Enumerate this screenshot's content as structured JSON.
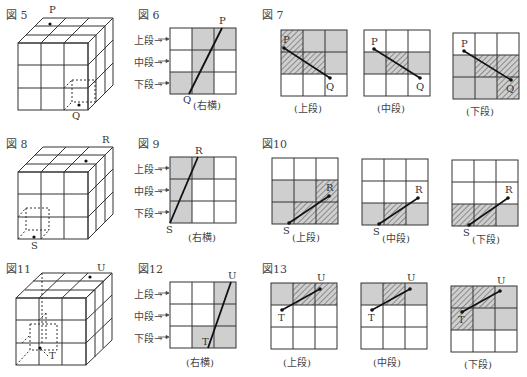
{
  "colors": {
    "gray": "#cfcfcf",
    "line": "#333333",
    "hatch": "#7a7a7a",
    "bg": "#ffffff"
  },
  "row_labels": {
    "top": "上段→",
    "middle": "中段→",
    "bottom": "下段→"
  },
  "figures": {
    "fig5": {
      "label": "図 5",
      "points": [
        "P",
        "Q"
      ]
    },
    "fig6": {
      "label": "図 6",
      "caption": "(右横)",
      "points": [
        "P",
        "Q"
      ],
      "gray_cells": [
        [
          0,
          1
        ],
        [
          0,
          2
        ],
        [
          1,
          1
        ],
        [
          2,
          0
        ],
        [
          2,
          1
        ]
      ]
    },
    "fig7": {
      "label": "図 7",
      "panels": [
        {
          "caption": "(上段)",
          "gray": [
            [
              0,
              1
            ],
            [
              0,
              2
            ],
            [
              1,
              2
            ]
          ],
          "hatch": [
            [
              0,
              0
            ],
            [
              1,
              0
            ],
            [
              1,
              1
            ]
          ],
          "p": "P",
          "q": "Q"
        },
        {
          "caption": "(中段)",
          "gray": [
            [
              1,
              0
            ],
            [
              1,
              2
            ]
          ],
          "hatch": [
            [
              1,
              1
            ]
          ],
          "p": "P",
          "q": "Q"
        },
        {
          "caption": "(下段)",
          "gray": [
            [
              1,
              0
            ],
            [
              2,
              0
            ],
            [
              2,
              1
            ]
          ],
          "hatch": [
            [
              1,
              1
            ],
            [
              1,
              2
            ],
            [
              2,
              2
            ]
          ],
          "p": "P",
          "q": "Q"
        }
      ]
    },
    "fig8": {
      "label": "図 8",
      "points": [
        "R",
        "S"
      ]
    },
    "fig9": {
      "label": "図 9",
      "caption": "(右横)",
      "points": [
        "R",
        "S"
      ],
      "gray_cells": [
        [
          0,
          0
        ],
        [
          0,
          1
        ],
        [
          1,
          0
        ],
        [
          2,
          0
        ]
      ]
    },
    "fig10": {
      "label": "図10",
      "panels": [
        {
          "caption": "(上段)",
          "gray": [
            [
              1,
              0
            ],
            [
              1,
              1
            ],
            [
              2,
              0
            ]
          ],
          "hatch": [
            [
              1,
              2
            ],
            [
              2,
              1
            ],
            [
              2,
              2
            ]
          ],
          "p": "R",
          "q": "S"
        },
        {
          "caption": "(中段)",
          "gray": [
            [
              2,
              0
            ],
            [
              2,
              2
            ]
          ],
          "hatch": [
            [
              2,
              1
            ]
          ],
          "p": "R",
          "q": "S"
        },
        {
          "caption": "(下段)",
          "gray": [
            [
              2,
              2
            ]
          ],
          "hatch": [
            [
              2,
              0
            ],
            [
              2,
              1
            ]
          ],
          "p": "R",
          "q": "S"
        }
      ]
    },
    "fig11": {
      "label": "図11",
      "points": [
        "U",
        "T"
      ]
    },
    "fig12": {
      "label": "図12",
      "caption": "(右横)",
      "points": [
        "U",
        "T"
      ],
      "gray_cells": [
        [
          0,
          2
        ],
        [
          1,
          2
        ],
        [
          2,
          1
        ],
        [
          2,
          2
        ]
      ]
    },
    "fig13": {
      "label": "図13",
      "panels": [
        {
          "caption": "(上段)",
          "gray": [
            [
              0,
              0
            ]
          ],
          "hatch": [
            [
              0,
              1
            ],
            [
              0,
              2
            ]
          ],
          "p": "U",
          "q": "T"
        },
        {
          "caption": "(中段)",
          "gray": [
            [
              0,
              0
            ],
            [
              0,
              2
            ]
          ],
          "hatch": [
            [
              0,
              1
            ]
          ],
          "p": "U",
          "q": "T"
        },
        {
          "caption": "(下段)",
          "gray": [
            [
              0,
              2
            ],
            [
              1,
              1
            ],
            [
              1,
              2
            ]
          ],
          "hatch": [
            [
              0,
              0
            ],
            [
              0,
              1
            ],
            [
              1,
              0
            ]
          ],
          "p": "U",
          "q": "T"
        }
      ]
    }
  }
}
